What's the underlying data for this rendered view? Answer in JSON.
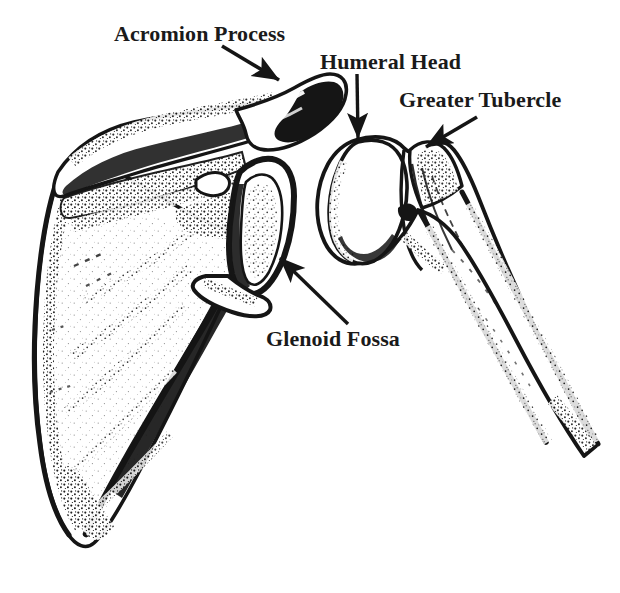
{
  "figure": {
    "background_color": "#ffffff",
    "ink_color": "#151515",
    "text_color": "#1a1a1a",
    "width": 620,
    "height": 593
  },
  "labels": {
    "acromion_process": "Acromion Process",
    "humeral_head": "Humeral Head",
    "greater_tubercle": "Greater Tubercle",
    "glenoid_fossa": "Glenoid Fossa"
  },
  "annotations": [
    {
      "id": "acromion-process",
      "text": "Acromion Process",
      "label_x": 114,
      "label_y": 22,
      "arrow_from_x": 222,
      "arrow_from_y": 46,
      "arrow_to_x": 279,
      "arrow_to_y": 80,
      "points_to": "acromion process of scapula"
    },
    {
      "id": "humeral-head",
      "text": "Humeral Head",
      "label_x": 320,
      "label_y": 50,
      "arrow_from_x": 357,
      "arrow_from_y": 74,
      "arrow_to_x": 358,
      "arrow_to_y": 138,
      "points_to": "head of humerus"
    },
    {
      "id": "greater-tubercle",
      "text": "Greater Tubercle",
      "label_x": 399,
      "label_y": 88,
      "arrow_from_x": 477,
      "arrow_from_y": 117,
      "arrow_to_x": 426,
      "arrow_to_y": 147,
      "points_to": "greater tubercle of humerus"
    },
    {
      "id": "glenoid-fossa",
      "text": "Glenoid Fossa",
      "label_x": 266,
      "label_y": 327,
      "arrow_from_x": 348,
      "arrow_from_y": 324,
      "arrow_to_x": 280,
      "arrow_to_y": 258,
      "points_to": "glenoid fossa of scapula"
    }
  ],
  "structures": [
    {
      "id": "scapula",
      "name": "Scapula",
      "side": "left"
    },
    {
      "id": "humerus",
      "name": "Humerus",
      "side": "right"
    }
  ]
}
